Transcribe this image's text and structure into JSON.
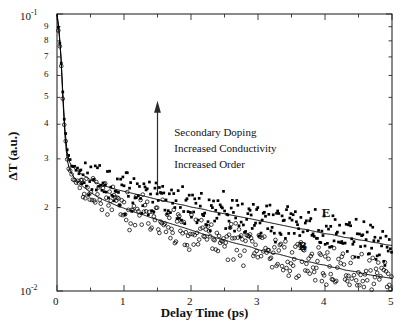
{
  "chart_data": {
    "type": "scatter",
    "title": "",
    "xlabel": "Delay Time (ps)",
    "ylabel": "ΔT (a.u.)",
    "xlim": [
      0,
      5
    ],
    "ylim": [
      0.01,
      0.1
    ],
    "yscale": "log",
    "xscale": "linear",
    "grid": false,
    "legend_position": "inline-labels",
    "xticks": [
      0,
      1,
      2,
      3,
      4,
      5
    ],
    "xticklabels": [
      "0",
      "1",
      "2",
      "3",
      "4",
      "5"
    ],
    "xminor_step": 0.5,
    "yticks_major": [
      0.01,
      0.1
    ],
    "yticklabels_major": [
      "10-2",
      "10-1"
    ],
    "yticks_minor_labeled": [
      0.02,
      0.03,
      0.04,
      0.05,
      0.06,
      0.07,
      0.08,
      0.09
    ],
    "yticklabels_minor": [
      "2",
      "3",
      "4",
      "5",
      "6",
      "7",
      "8",
      "9"
    ],
    "series": [
      {
        "name": "E",
        "label": "E",
        "marker": "filled-square",
        "color": "#000000",
        "fit_line": true,
        "x": [
          0.0,
          0.03,
          0.06,
          0.09,
          0.12,
          0.15,
          0.18,
          0.21,
          0.25,
          0.3,
          0.35,
          0.4,
          0.5,
          0.6,
          0.7,
          0.8,
          0.9,
          1.0,
          1.1,
          1.2,
          1.3,
          1.4,
          1.5,
          1.6,
          1.7,
          1.8,
          1.9,
          2.0,
          2.1,
          2.2,
          2.3,
          2.4,
          2.5,
          2.6,
          2.7,
          2.8,
          2.9,
          3.0,
          3.1,
          3.2,
          3.3,
          3.4,
          3.5,
          3.6,
          3.7,
          3.8,
          3.9,
          4.0,
          4.1,
          4.2,
          4.3,
          4.4,
          4.5,
          4.6,
          4.7,
          4.8,
          4.9,
          5.0
        ],
        "y": [
          0.1,
          0.088,
          0.07,
          0.05,
          0.038,
          0.032,
          0.0295,
          0.0285,
          0.0278,
          0.0272,
          0.0266,
          0.0261,
          0.0252,
          0.0245,
          0.024,
          0.0236,
          0.0232,
          0.0229,
          0.0226,
          0.0223,
          0.022,
          0.0217,
          0.0214,
          0.0211,
          0.0209,
          0.0206,
          0.0204,
          0.0201,
          0.0199,
          0.0197,
          0.0194,
          0.0192,
          0.019,
          0.0188,
          0.0186,
          0.0184,
          0.0182,
          0.018,
          0.0178,
          0.0176,
          0.0174,
          0.0172,
          0.017,
          0.0168,
          0.0167,
          0.0165,
          0.0163,
          0.0161,
          0.016,
          0.0158,
          0.0156,
          0.0155,
          0.0153,
          0.0152,
          0.015,
          0.0149,
          0.0147,
          0.0146
        ]
      },
      {
        "name": "B",
        "label": "B",
        "marker": "open-circle",
        "color": "#000000",
        "fit_line": true,
        "x": [
          0.0,
          0.03,
          0.06,
          0.09,
          0.12,
          0.15,
          0.18,
          0.21,
          0.25,
          0.3,
          0.35,
          0.4,
          0.5,
          0.6,
          0.7,
          0.8,
          0.9,
          1.0,
          1.1,
          1.2,
          1.3,
          1.4,
          1.5,
          1.6,
          1.7,
          1.8,
          1.9,
          2.0,
          2.1,
          2.2,
          2.3,
          2.4,
          2.5,
          2.6,
          2.7,
          2.8,
          2.9,
          3.0,
          3.1,
          3.2,
          3.3,
          3.4,
          3.5,
          3.6,
          3.7,
          3.8,
          3.9,
          4.0,
          4.1,
          4.2,
          4.3,
          4.4,
          4.5,
          4.6,
          4.7,
          4.8,
          4.9,
          5.0
        ],
        "y": [
          0.1,
          0.086,
          0.069,
          0.048,
          0.036,
          0.03,
          0.0278,
          0.0268,
          0.0258,
          0.025,
          0.0243,
          0.0237,
          0.0227,
          0.0219,
          0.0213,
          0.0208,
          0.0203,
          0.0199,
          0.0195,
          0.0191,
          0.0188,
          0.0184,
          0.0181,
          0.0178,
          0.0175,
          0.0172,
          0.0169,
          0.0166,
          0.0163,
          0.016,
          0.0158,
          0.0155,
          0.0153,
          0.015,
          0.0148,
          0.0146,
          0.0144,
          0.0141,
          0.0139,
          0.0137,
          0.0136,
          0.0134,
          0.0132,
          0.013,
          0.0128,
          0.0127,
          0.0125,
          0.0124,
          0.0122,
          0.0121,
          0.0119,
          0.0118,
          0.0117,
          0.0115,
          0.0114,
          0.0113,
          0.0112,
          0.0111
        ]
      }
    ],
    "annotations": [
      {
        "name": "trend-arrow",
        "type": "arrow",
        "x": 1.5,
        "y_start": 0.0225,
        "y_end": 0.047,
        "direction": "up"
      },
      {
        "name": "trend-text",
        "type": "text",
        "x": 1.75,
        "lines": [
          "Secondary Doping",
          "Increased Conductivity",
          "Increased Order"
        ]
      },
      {
        "name": "curve-label-E",
        "type": "text",
        "text": "E",
        "x": 3.95,
        "y": 0.0173
      },
      {
        "name": "curve-label-B",
        "type": "text",
        "text": "B",
        "x": 3.6,
        "y": 0.0133
      }
    ]
  },
  "axis": {
    "y_top_label_mantissa": "10",
    "y_top_label_exp": "-1",
    "y_bottom_label_mantissa": "10",
    "y_bottom_label_exp": "-2"
  }
}
